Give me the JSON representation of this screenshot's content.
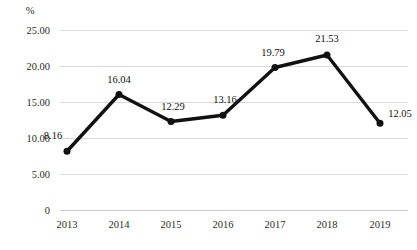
{
  "chart_data": {
    "type": "line",
    "title": "",
    "subtitle": "",
    "xlabel": "",
    "ylabel": "%",
    "unit_label": "%",
    "categories": [
      "2013",
      "2014",
      "2015",
      "2016",
      "2017",
      "2018",
      "2019"
    ],
    "values": [
      8.16,
      16.04,
      12.29,
      13.16,
      19.79,
      21.53,
      12.05
    ],
    "point_labels": [
      "8.16",
      "16.04",
      "12.29",
      "13.16",
      "19.79",
      "21.53",
      "12.05"
    ],
    "series": [
      {
        "name": "",
        "values": [
          8.16,
          16.04,
          12.29,
          13.16,
          19.79,
          21.53,
          12.05
        ]
      }
    ],
    "ylim": [
      0,
      25
    ],
    "ytick_values": [
      0,
      5,
      10,
      15,
      20,
      25
    ],
    "ytick_labels": [
      "0",
      "5.00",
      "10.00",
      "15.00",
      "20.00",
      "25.00"
    ],
    "grid": true,
    "grid_axis": "y",
    "legend": false,
    "legend_position": "none",
    "line_color": "#111111",
    "marker_color": "#111111",
    "grid_color": "#d9d9d9",
    "background_color": "#ffffff",
    "label_placement": [
      "above-left",
      "above",
      "above",
      "above",
      "above",
      "above",
      "right"
    ]
  },
  "layout": {
    "plot_left": 60,
    "plot_right": 408,
    "plot_top": 30,
    "plot_bottom": 210,
    "point_x": [
      67,
      119,
      171,
      223,
      275,
      327,
      380
    ],
    "unit_label_x": 30,
    "unit_label_y": 14,
    "xtick_label_y": 228,
    "label_offsets": [
      {
        "dx": -14,
        "dy": -12
      },
      {
        "dx": 0,
        "dy": -12
      },
      {
        "dx": 2,
        "dy": -12
      },
      {
        "dx": 2,
        "dy": -12
      },
      {
        "dx": -2,
        "dy": -12
      },
      {
        "dx": 0,
        "dy": -13
      },
      {
        "dx": 20,
        "dy": -6
      }
    ]
  }
}
